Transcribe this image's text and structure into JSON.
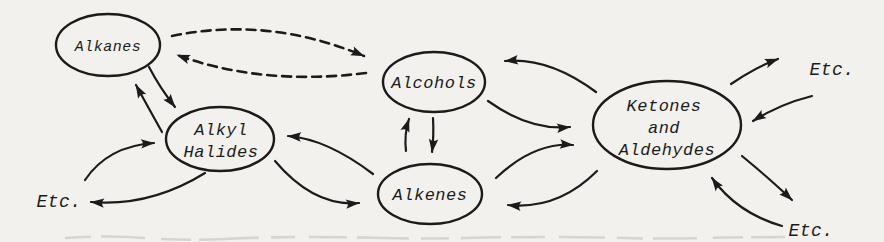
{
  "colors": {
    "background": "#f2f1ed",
    "ink": "#1b1b1b"
  },
  "nodes": {
    "alkanes": {
      "label": "Alkanes"
    },
    "alkyl_halides": {
      "line1": "Alkyl",
      "line2": "Halides"
    },
    "alcohols": {
      "label": "Alcohols"
    },
    "alkenes": {
      "label": "Alkenes"
    },
    "ketones_aldehydes": {
      "line1": "Ketones",
      "line2": "and",
      "line3": "Aldehydes"
    }
  },
  "labels": {
    "etc_left": "Etc.",
    "etc_top_right": "Etc.",
    "etc_bottom_right": "Etc."
  },
  "edges": [
    {
      "from": "Alkanes",
      "to": "Alcohols",
      "style": "dashed"
    },
    {
      "from": "Alcohols",
      "to": "Alkanes",
      "style": "dashed"
    },
    {
      "from": "Alkanes",
      "to": "Alkyl Halides",
      "style": "solid"
    },
    {
      "from": "Alkyl Halides",
      "to": "Alkanes",
      "style": "solid"
    },
    {
      "from": "Etc. (left)",
      "to": "Alkyl Halides",
      "style": "solid"
    },
    {
      "from": "Alkyl Halides",
      "to": "Etc. (left)",
      "style": "solid"
    },
    {
      "from": "Alkenes",
      "to": "Alkyl Halides",
      "style": "solid"
    },
    {
      "from": "Alkyl Halides",
      "to": "Alkenes",
      "style": "solid"
    },
    {
      "from": "Alkenes",
      "to": "Alcohols",
      "style": "solid"
    },
    {
      "from": "Alcohols",
      "to": "Alkenes",
      "style": "solid"
    },
    {
      "from": "Ketones and Aldehydes",
      "to": "Alcohols",
      "style": "solid"
    },
    {
      "from": "Alcohols",
      "to": "Ketones and Aldehydes",
      "style": "solid"
    },
    {
      "from": "Alkenes",
      "to": "Ketones and Aldehydes",
      "style": "solid"
    },
    {
      "from": "Ketones and Aldehydes",
      "to": "Alkenes",
      "style": "solid"
    },
    {
      "from": "Ketones and Aldehydes",
      "to": "Etc. (top right)",
      "style": "solid"
    },
    {
      "from": "Etc. (top right)",
      "to": "Ketones and Aldehydes",
      "style": "solid"
    },
    {
      "from": "Ketones and Aldehydes",
      "to": "Etc. (bottom right)",
      "style": "solid"
    },
    {
      "from": "Etc. (bottom right)",
      "to": "Ketones and Aldehydes",
      "style": "solid"
    }
  ]
}
